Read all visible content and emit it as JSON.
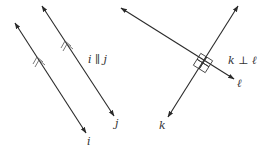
{
  "figures": [
    {
      "id": "parallel",
      "relation_label": "i ∥ j",
      "lines": [
        {
          "name": "i",
          "label": "i",
          "from": [
            15,
            23
          ],
          "to": [
            86,
            133
          ]
        },
        {
          "name": "j",
          "label": "j",
          "from": [
            42,
            6
          ],
          "to": [
            114,
            116
          ]
        }
      ],
      "marker": "double-chevron"
    },
    {
      "id": "perpendicular",
      "relation_label": "k ⊥ ℓ",
      "lines": [
        {
          "name": "k",
          "label": "k",
          "from": [
            238,
            6
          ],
          "to": [
            168,
            117
          ]
        },
        {
          "name": "l",
          "label": "ℓ",
          "from": [
            121,
            8
          ],
          "to": [
            234,
            79
          ]
        }
      ],
      "marker": "right-angle-squares",
      "intersection": [
        203,
        63
      ]
    }
  ],
  "colors": {
    "line": "#2a2a2a",
    "text": "#333333",
    "background": "#ffffff"
  }
}
